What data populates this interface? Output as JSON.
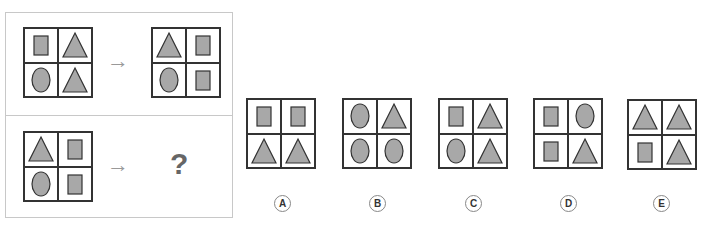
{
  "colors": {
    "shape_fill": "#a8a8a8",
    "shape_stroke": "#333333",
    "border": "#333333",
    "panel_border": "#c8c8c8"
  },
  "question": {
    "example": {
      "input": [
        "rectangle",
        "triangle",
        "ellipse",
        "triangle"
      ],
      "output": [
        "triangle",
        "rectangle",
        "ellipse",
        "rectangle"
      ]
    },
    "test": {
      "input": [
        "triangle",
        "rectangle",
        "ellipse",
        "rectangle"
      ],
      "unknown": "?"
    },
    "arrow": "→"
  },
  "options": [
    {
      "label": "A",
      "cells": [
        "rectangle",
        "rectangle",
        "triangle",
        "triangle"
      ]
    },
    {
      "label": "B",
      "cells": [
        "ellipse",
        "triangle",
        "ellipse",
        "ellipse"
      ]
    },
    {
      "label": "C",
      "cells": [
        "rectangle",
        "triangle",
        "ellipse",
        "triangle"
      ]
    },
    {
      "label": "D",
      "cells": [
        "rectangle",
        "ellipse",
        "rectangle",
        "triangle"
      ]
    },
    {
      "label": "E",
      "cells": [
        "triangle",
        "triangle",
        "rectangle",
        "triangle"
      ]
    }
  ]
}
